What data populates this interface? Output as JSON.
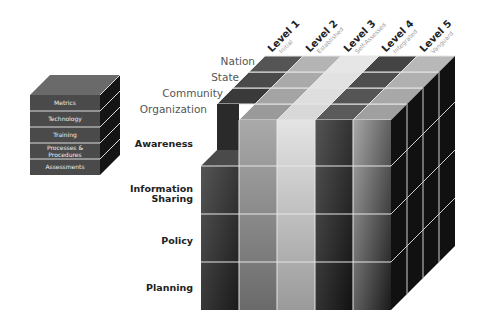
{
  "small_cube": {
    "layers": [
      "Metrics",
      "Technology",
      "Training",
      "Processes & Procedures",
      "Assessments"
    ]
  },
  "tiers": [
    "Nation",
    "State",
    "Community",
    "Organization"
  ],
  "dimensions": [
    "Awareness",
    "Information Sharing",
    "Policy",
    "Planning"
  ],
  "levels": [
    {
      "title": "Level 1",
      "subtitle": "Initial"
    },
    {
      "title": "Level 2",
      "subtitle": "Established"
    },
    {
      "title": "Level 3",
      "subtitle": "Self-Assessed"
    },
    {
      "title": "Level 4",
      "subtitle": "Integrated"
    },
    {
      "title": "Level 5",
      "subtitle": "Vanguard"
    }
  ],
  "colors": {
    "level1": "#3a3a3a",
    "level2": "#9a9a9a",
    "level3": "#d8d8d8",
    "level4": "#2a2a2a",
    "level5": "#7a7a7a",
    "side": "#111111",
    "grid": "#e6e6e6"
  }
}
